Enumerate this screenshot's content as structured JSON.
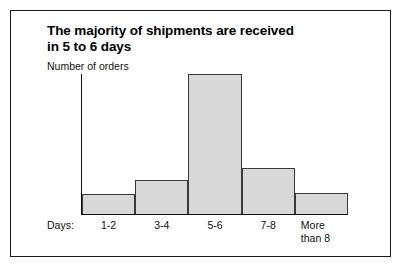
{
  "figure": {
    "title_line1": "The majority of shipments are received",
    "title_line2": "in 5 to 6 days",
    "days_label": "Days:",
    "border_color": "#1a1a1a",
    "background_color": "#ffffff"
  },
  "chart_data": {
    "type": "bar",
    "title": "The majority of shipments are received in 5 to 6 days",
    "xlabel": "Days:",
    "ylabel": "Number of orders",
    "categories": [
      "1-2",
      "3-4",
      "5-6",
      "7-8",
      "More\nthan 8"
    ],
    "values": [
      14,
      24,
      100,
      33,
      15
    ],
    "ylim": [
      0,
      100
    ],
    "grid": false,
    "legend": "none",
    "bar_fill_color": "#d8d8d8",
    "bar_edge_color": "#3a3a3a",
    "axis_color": "#111111"
  }
}
